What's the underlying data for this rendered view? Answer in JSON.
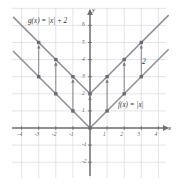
{
  "figure": {
    "kind": "cartesian-graph",
    "axis_labels": {
      "x": "x",
      "y": "y"
    },
    "annotation_shift": "2",
    "curve_labels": {
      "g": "g(x) = |x| + 2",
      "f": "f(x) = |x|"
    },
    "colors": {
      "grid": "#d9d9dd",
      "axis": "#6f6f72",
      "curve": "#8e8e94",
      "marker": "#6a6a70",
      "arrow": "#7a7a80",
      "text": "#3a3a3a"
    }
  },
  "chart_data": {
    "type": "line",
    "title": "",
    "xlabel": "x",
    "ylabel": "y",
    "xlim": [
      -4.6,
      4.9
    ],
    "ylim": [
      -2.6,
      7.2
    ],
    "grid": true,
    "legend": "inline-labels",
    "xticks": [
      -4,
      -3,
      -2,
      -1,
      1,
      2,
      3,
      4
    ],
    "xtick_labels": [
      "-4",
      "-3",
      "-2",
      "-1",
      "1",
      "2",
      "3",
      "4"
    ],
    "yticks": [
      -2,
      -1,
      1,
      2,
      3,
      4,
      5,
      6
    ],
    "ytick_labels": [
      "-2",
      "-1",
      "1",
      "2",
      "3",
      "4",
      "5",
      "6"
    ],
    "series": [
      {
        "name": "f(x) = |x|",
        "label": "f(x) = |x|",
        "x": [
          -4.5,
          0,
          4.6
        ],
        "y": [
          4.5,
          0,
          4.6
        ],
        "markers_x": [
          -3,
          -2,
          -1,
          0,
          1,
          2,
          3
        ],
        "markers_y": [
          3,
          2,
          1,
          0,
          1,
          2,
          3
        ]
      },
      {
        "name": "g(x) = |x| + 2",
        "label": "g(x) = |x| + 2",
        "x": [
          -4.5,
          0,
          4.6
        ],
        "y": [
          6.5,
          2,
          6.6
        ],
        "markers_x": [
          -3,
          -2,
          -1,
          0,
          1,
          2,
          3
        ],
        "markers_y": [
          5,
          4,
          3,
          2,
          3,
          4,
          5
        ]
      }
    ],
    "arrows": {
      "description": "vertical translation arrows of length 2 from f(x) to g(x)",
      "x": [
        -3,
        -2,
        -1,
        0,
        1,
        2,
        3
      ],
      "from_y": [
        3,
        2,
        1,
        0,
        1,
        2,
        3
      ],
      "to_y": [
        5,
        4,
        3,
        2,
        3,
        4,
        5
      ],
      "length_label": "2"
    }
  }
}
